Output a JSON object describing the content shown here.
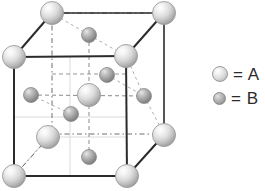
{
  "figure": {
    "type": "crystal-unit-cell-diagram"
  },
  "legend": {
    "rows": [
      {
        "symbol": "large-sphere",
        "label": "= A",
        "color": "#d8d8d8"
      },
      {
        "symbol": "small-sphere",
        "label": "= B",
        "color": "#a5a5a5"
      }
    ]
  },
  "colors": {
    "background": "#ffffff",
    "edge_solid": "#2b2b2b",
    "edge_hidden": "#7a7a7a",
    "guide_line": "#d0d0d0",
    "atom_a_fill": "#e6e6e6",
    "atom_a_stroke": "#9c9c9c",
    "atom_b_fill": "#a5a5a5",
    "atom_b_stroke": "#8a8a8a",
    "legend_text": "#2b2b2b"
  },
  "geometry": {
    "front_face": [
      {
        "name": "front-top-left",
        "x": 14,
        "y": 57
      },
      {
        "name": "front-top-right",
        "x": 126,
        "y": 56
      },
      {
        "name": "front-bottom-right",
        "x": 127,
        "y": 176
      },
      {
        "name": "front-bottom-left",
        "x": 14,
        "y": 176
      }
    ],
    "back_face": [
      {
        "name": "back-top-left",
        "x": 52,
        "y": 13
      },
      {
        "name": "back-top-right",
        "x": 164,
        "y": 13
      },
      {
        "name": "back-bottom-right",
        "x": 164,
        "y": 134
      },
      {
        "name": "back-bottom-left",
        "x": 52,
        "y": 134
      }
    ]
  },
  "atoms_a": [
    {
      "id": "A1",
      "site": "corner-front-top-left",
      "x": 14,
      "y": 57,
      "r": 11
    },
    {
      "id": "A2",
      "site": "corner-front-top-right",
      "x": 126,
      "y": 56,
      "r": 11
    },
    {
      "id": "A3",
      "site": "corner-front-bottom-left",
      "x": 14,
      "y": 176,
      "r": 11
    },
    {
      "id": "A4",
      "site": "corner-front-bottom-right",
      "x": 127,
      "y": 176,
      "r": 11
    },
    {
      "id": "A5",
      "site": "corner-back-top-left",
      "x": 52,
      "y": 13,
      "r": 11
    },
    {
      "id": "A6",
      "site": "corner-back-top-right",
      "x": 164,
      "y": 13,
      "r": 11
    },
    {
      "id": "A7",
      "site": "corner-back-bottom-right",
      "x": 164,
      "y": 135,
      "r": 11
    },
    {
      "id": "A8",
      "site": "face-center-left",
      "x": 48,
      "y": 137,
      "r": 11
    },
    {
      "id": "A9",
      "site": "body-center-face",
      "x": 89,
      "y": 95,
      "r": 11
    }
  ],
  "atoms_b": [
    {
      "id": "B1",
      "site": "tetrahedral-upper-back",
      "x": 89,
      "y": 35,
      "r": 7
    },
    {
      "id": "B2",
      "site": "tetrahedral-left",
      "x": 31,
      "y": 95,
      "r": 7
    },
    {
      "id": "B3",
      "site": "tetrahedral-upper-mid",
      "x": 107,
      "y": 75,
      "r": 7
    },
    {
      "id": "B4",
      "site": "tetrahedral-lower-mid",
      "x": 71,
      "y": 114,
      "r": 7
    },
    {
      "id": "B5",
      "site": "tetrahedral-right",
      "x": 144,
      "y": 96,
      "r": 7
    },
    {
      "id": "B6",
      "site": "tetrahedral-lower-front",
      "x": 89,
      "y": 157,
      "r": 7
    }
  ]
}
